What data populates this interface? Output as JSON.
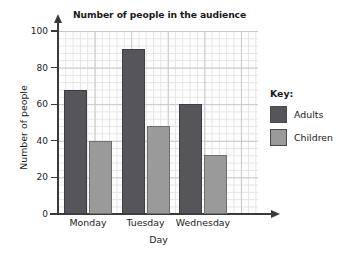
{
  "chart_data": {
    "type": "bar",
    "title": "Number of people in the audience",
    "xlabel": "Day",
    "ylabel": "Number of people",
    "categories": [
      "Monday",
      "Tuesday",
      "Wednesday"
    ],
    "series": [
      {
        "name": "Adults",
        "values": [
          68,
          90,
          60
        ],
        "color": "#55555a"
      },
      {
        "name": "Children",
        "values": [
          40,
          48,
          32
        ],
        "color": "#9a9a9a"
      }
    ],
    "ylim": [
      0,
      100
    ],
    "yticks": [
      0,
      20,
      40,
      60,
      80,
      100
    ],
    "ytick_labels": [
      "0",
      "20",
      "40",
      "60",
      "80",
      "100"
    ],
    "grid": true,
    "grid_style": "graph-paper",
    "legend_position": "right",
    "legend_title": "Key:"
  }
}
